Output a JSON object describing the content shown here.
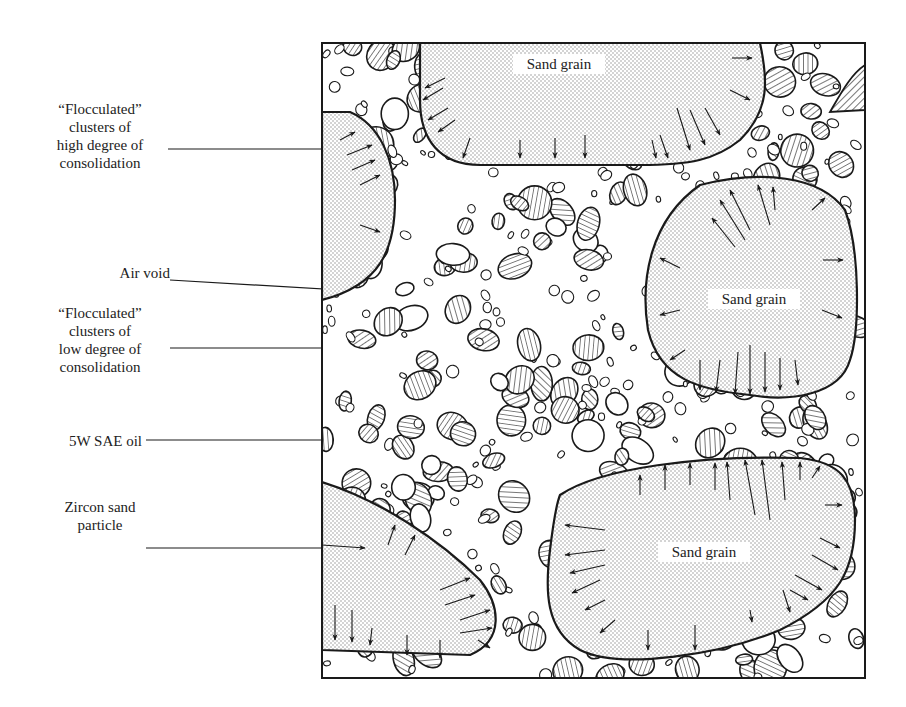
{
  "figure": {
    "type": "schematic cross-section"
  },
  "callouts": [
    {
      "id": "floc-high",
      "lines": [
        "“Flocculated”",
        "clusters of",
        "high degree of",
        "consolidation"
      ]
    },
    {
      "id": "air-void",
      "lines": [
        "Air void"
      ]
    },
    {
      "id": "floc-low",
      "lines": [
        "“Flocculated”",
        "clusters of",
        "low degree of",
        "consolidation"
      ]
    },
    {
      "id": "oil",
      "lines": [
        "5W SAE oil"
      ]
    },
    {
      "id": "zircon",
      "lines": [
        "Zircon sand",
        "particle"
      ]
    }
  ],
  "grains": [
    {
      "id": "top",
      "label": "Sand grain"
    },
    {
      "id": "right-middle",
      "label": "Sand grain"
    },
    {
      "id": "bottom-right",
      "label": "Sand grain"
    }
  ],
  "colors": {
    "ink": "#1a1a1a",
    "stipple": "#8a8a8a",
    "background": "#ffffff"
  }
}
